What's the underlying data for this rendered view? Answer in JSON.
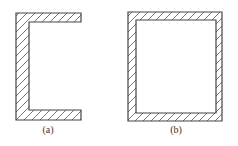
{
  "figure": {
    "colors": {
      "stroke": "#444444",
      "hatch": "#555555",
      "background": "#ffffff"
    },
    "panels": [
      {
        "id": "a",
        "label": "(a)",
        "shape": "channel (C-section) open to the right"
      },
      {
        "id": "b",
        "label": "(b)",
        "shape": "closed rectangular box section"
      }
    ]
  }
}
